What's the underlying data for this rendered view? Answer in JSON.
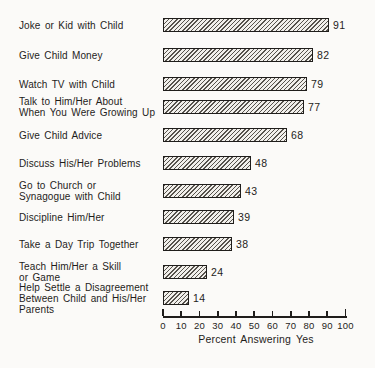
{
  "chart_data": {
    "type": "bar",
    "orientation": "horizontal",
    "title": "",
    "xlabel": "Percent Answering Yes",
    "ylabel": "",
    "xlim": [
      0,
      100
    ],
    "xticks": [
      0,
      10,
      20,
      30,
      40,
      50,
      60,
      70,
      80,
      90,
      100
    ],
    "grid": false,
    "legend": false,
    "bar_style": "diagonal-hatch",
    "categories": [
      "Joke or Kid with Child",
      "Give Child Money",
      "Watch TV with Child",
      "Talk to Him/Her About\nWhen You Were Growing Up",
      "Give Child Advice",
      "Discuss His/Her Problems",
      "Go to Church or\nSynagogue with Child",
      "Discipline Him/Her",
      "Take a Day Trip Together",
      "Teach Him/Her a Skill\nor Game",
      "Help Settle a Disagreement\nBetween Child and His/Her\nParents"
    ],
    "values": [
      91,
      82,
      79,
      77,
      68,
      48,
      43,
      39,
      38,
      24,
      14
    ],
    "value_labels": [
      "91",
      "82",
      "79",
      "77",
      "68",
      "48",
      "43",
      "39",
      "38",
      "24",
      "14"
    ]
  },
  "style": {
    "ink_color": "#1f1d1b",
    "background_color": "#fbfaf8",
    "bar_fill_color": "#f1efeb",
    "hatch_line_color": "#56524c"
  }
}
